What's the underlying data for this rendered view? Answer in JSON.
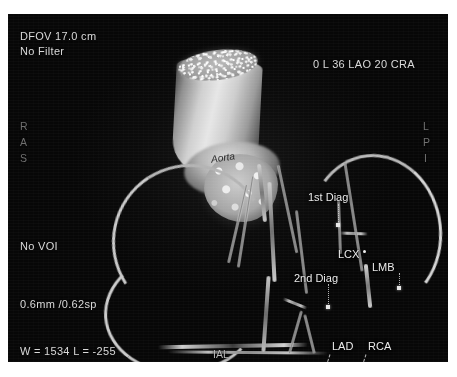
{
  "modality": "cardiac-ct-angiography-3d-volume-rendering",
  "overlay": {
    "top_left": {
      "dfov": "DFOV 17.0 cm",
      "filter": "No Filter"
    },
    "top_right": {
      "view_angles": "0 L 36 LAO 20 CRA"
    },
    "left_column": {
      "voi": "No VOI",
      "slice": "0.6mm /0.62sp",
      "window_level": "W = 1534 L = -255"
    },
    "orientation_left": [
      "R",
      "A",
      "S"
    ],
    "orientation_right": [
      "L",
      "P",
      "I"
    ]
  },
  "annotations": [
    {
      "label": "Aorta",
      "name": "aorta"
    },
    {
      "label": "1st Diag",
      "name": "first-diagonal-branch"
    },
    {
      "label": "LCX",
      "name": "left-circumflex-artery"
    },
    {
      "label": "LMB",
      "name": "left-main-branch"
    },
    {
      "label": "2nd Diag",
      "name": "second-diagonal-branch"
    },
    {
      "label": "IAL",
      "name": "intermediate-artery"
    },
    {
      "label": "LAD",
      "name": "left-anterior-descending-artery"
    },
    {
      "label": "RCA",
      "name": "right-coronary-artery"
    }
  ],
  "colors": {
    "background": "#ffffff",
    "image_background": "#0a0a0a",
    "overlay_text": "#d9d9d9",
    "orientation_text": "#6f6f6f",
    "annotation_text": "#eaeaea",
    "vessel_highlight": "#d2d2d2"
  }
}
